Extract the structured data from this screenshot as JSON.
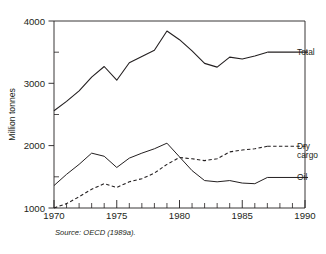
{
  "caption": "Figure 1. Development of world seaborne trade by cargo type, 1970-1987",
  "source": "Source: OECD (1989a).",
  "chart_data": {
    "type": "line",
    "title": "",
    "xlabel": "",
    "ylabel": "Million tonnes",
    "xlim": [
      1970,
      1990
    ],
    "ylim": [
      1000,
      4000
    ],
    "xticks": [
      1970,
      1975,
      1980,
      1985,
      1990
    ],
    "xtick_labels": [
      "1970",
      "1975",
      "1980",
      "1985",
      "1990"
    ],
    "yticks": [
      1000,
      2000,
      3000,
      4000
    ],
    "ytick_labels": [
      "1000",
      "2000",
      "3000",
      "4000"
    ],
    "minor_yticks": [
      1500,
      2500,
      3500
    ],
    "minor_xtick_interval": 1,
    "grid": false,
    "legend_position": "right-inline",
    "x": [
      1970,
      1971,
      1972,
      1973,
      1974,
      1975,
      1976,
      1977,
      1978,
      1979,
      1980,
      1981,
      1982,
      1983,
      1984,
      1985,
      1986,
      1987
    ],
    "series": [
      {
        "name": "Total",
        "label": "Total",
        "style": "solid",
        "color": "#231f20",
        "values": [
          2560,
          2710,
          2880,
          3100,
          3270,
          3050,
          3330,
          3430,
          3530,
          3840,
          3700,
          3520,
          3320,
          3260,
          3420,
          3390,
          3440,
          3500
        ]
      },
      {
        "name": "Dry cargo",
        "label": "Dry cargo",
        "label_lines": [
          "Dry",
          "cargo"
        ],
        "style": "dashed",
        "color": "#231f20",
        "values": [
          1000,
          1070,
          1180,
          1300,
          1390,
          1330,
          1420,
          1470,
          1560,
          1700,
          1810,
          1790,
          1760,
          1790,
          1900,
          1930,
          1950,
          1990
        ]
      },
      {
        "name": "Oil",
        "label": "Oil",
        "style": "solid",
        "color": "#231f20",
        "values": [
          1360,
          1540,
          1700,
          1880,
          1830,
          1650,
          1800,
          1880,
          1950,
          2040,
          1820,
          1600,
          1440,
          1420,
          1440,
          1400,
          1390,
          1490
        ]
      }
    ]
  }
}
